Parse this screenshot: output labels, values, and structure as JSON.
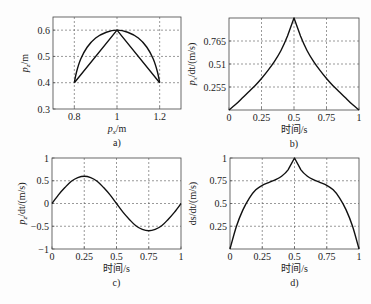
{
  "chart_data": [
    {
      "id": "a",
      "type": "line",
      "caption": "a)",
      "xlabel": "p_x/m",
      "ylabel": "p_z/m",
      "xlim": [
        0.7,
        1.3
      ],
      "ylim": [
        0.3,
        0.65
      ],
      "xticks": [
        0.8,
        1,
        1.2
      ],
      "xtick_labels": [
        "0.8",
        "1",
        "1.2"
      ],
      "yticks": [
        0.3,
        0.4,
        0.5,
        0.6
      ],
      "ytick_labels": [
        "0.3",
        "0.4",
        "0.5",
        "0.6"
      ],
      "grid": true,
      "series": [
        {
          "name": "arc path",
          "x": [
            0.8,
            0.81,
            0.83,
            0.86,
            0.9,
            0.95,
            1.0,
            1.05,
            1.1,
            1.14,
            1.17,
            1.19,
            1.2
          ],
          "y": [
            0.4,
            0.44,
            0.49,
            0.535,
            0.57,
            0.592,
            0.6,
            0.592,
            0.57,
            0.535,
            0.49,
            0.44,
            0.4
          ]
        },
        {
          "name": "straight path",
          "x": [
            0.8,
            1.0,
            1.2
          ],
          "y": [
            0.4,
            0.6,
            0.4
          ]
        }
      ]
    },
    {
      "id": "b",
      "type": "line",
      "caption": "b)",
      "xlabel": "时间/s",
      "ylabel": "p_x/dt/(m/s)",
      "xlim": [
        0,
        1
      ],
      "ylim": [
        0,
        1.02
      ],
      "xticks": [
        0,
        0.25,
        0.5,
        0.75,
        1
      ],
      "xtick_labels": [
        "0",
        "0.25",
        "0.5",
        "0.75",
        "1"
      ],
      "yticks": [
        0.255,
        0.51,
        0.765
      ],
      "ytick_labels": [
        "0.255",
        "0.51",
        "0.765"
      ],
      "grid": true,
      "series": [
        {
          "name": "dpx/dt",
          "x": [
            0,
            0.05,
            0.1,
            0.15,
            0.2,
            0.25,
            0.3,
            0.35,
            0.4,
            0.45,
            0.5,
            0.55,
            0.6,
            0.65,
            0.7,
            0.75,
            0.8,
            0.85,
            0.9,
            0.95,
            1
          ],
          "y": [
            0,
            0.06,
            0.13,
            0.2,
            0.27,
            0.35,
            0.44,
            0.54,
            0.66,
            0.82,
            1.02,
            0.82,
            0.66,
            0.54,
            0.44,
            0.35,
            0.27,
            0.2,
            0.13,
            0.06,
            0
          ]
        }
      ]
    },
    {
      "id": "c",
      "type": "line",
      "caption": "c)",
      "xlabel": "时间/s",
      "ylabel": "p_z/dt/(m/s)",
      "xlim": [
        0,
        1
      ],
      "ylim": [
        -1,
        1
      ],
      "xticks": [
        0,
        0.25,
        0.5,
        0.75,
        1
      ],
      "xtick_labels": [
        "0",
        "0.25",
        "0.5",
        "0.75",
        "1"
      ],
      "yticks": [
        -1,
        -0.5,
        0,
        0.5,
        1
      ],
      "ytick_labels": [
        "−1",
        "−0.5",
        "0",
        "0.5",
        "1"
      ],
      "grid": true,
      "series": [
        {
          "name": "dpz/dt",
          "x": [
            0,
            0.05,
            0.1,
            0.15,
            0.2,
            0.25,
            0.3,
            0.35,
            0.4,
            0.45,
            0.5,
            0.55,
            0.6,
            0.65,
            0.7,
            0.75,
            0.8,
            0.85,
            0.9,
            0.95,
            1
          ],
          "y": [
            0,
            0.19,
            0.35,
            0.49,
            0.57,
            0.6,
            0.57,
            0.49,
            0.35,
            0.19,
            0,
            -0.19,
            -0.35,
            -0.49,
            -0.57,
            -0.6,
            -0.57,
            -0.49,
            -0.35,
            -0.19,
            0
          ]
        }
      ]
    },
    {
      "id": "d",
      "type": "line",
      "caption": "d)",
      "xlabel": "时间/s",
      "ylabel": "ds/dt/(m/s)",
      "xlim": [
        0,
        1
      ],
      "ylim": [
        0,
        1
      ],
      "xticks": [
        0,
        0.25,
        0.5,
        0.75,
        1
      ],
      "xtick_labels": [
        "0",
        "0.25",
        "0.5",
        "0.75",
        "1"
      ],
      "yticks": [
        0.25,
        0.5,
        0.75,
        1
      ],
      "ytick_labels": [
        "0.25",
        "0.5",
        "0.75",
        "1"
      ],
      "grid": true,
      "series": [
        {
          "name": "ds/dt",
          "x": [
            0,
            0.05,
            0.1,
            0.15,
            0.2,
            0.25,
            0.3,
            0.35,
            0.4,
            0.45,
            0.5,
            0.55,
            0.6,
            0.65,
            0.7,
            0.75,
            0.8,
            0.85,
            0.9,
            0.95,
            1
          ],
          "y": [
            0,
            0.25,
            0.43,
            0.56,
            0.65,
            0.7,
            0.73,
            0.76,
            0.8,
            0.87,
            1.0,
            0.87,
            0.8,
            0.76,
            0.73,
            0.7,
            0.65,
            0.56,
            0.43,
            0.25,
            0
          ]
        }
      ]
    }
  ],
  "layout": {
    "panels": {
      "a": {
        "left": 53,
        "top": 17,
        "right": 181,
        "bottom": 109
      },
      "b": {
        "left": 229,
        "top": 18,
        "right": 359,
        "bottom": 110
      },
      "c": {
        "left": 52,
        "top": 158,
        "right": 181,
        "bottom": 249
      },
      "d": {
        "left": 230,
        "top": 158,
        "right": 359,
        "bottom": 249
      }
    }
  }
}
